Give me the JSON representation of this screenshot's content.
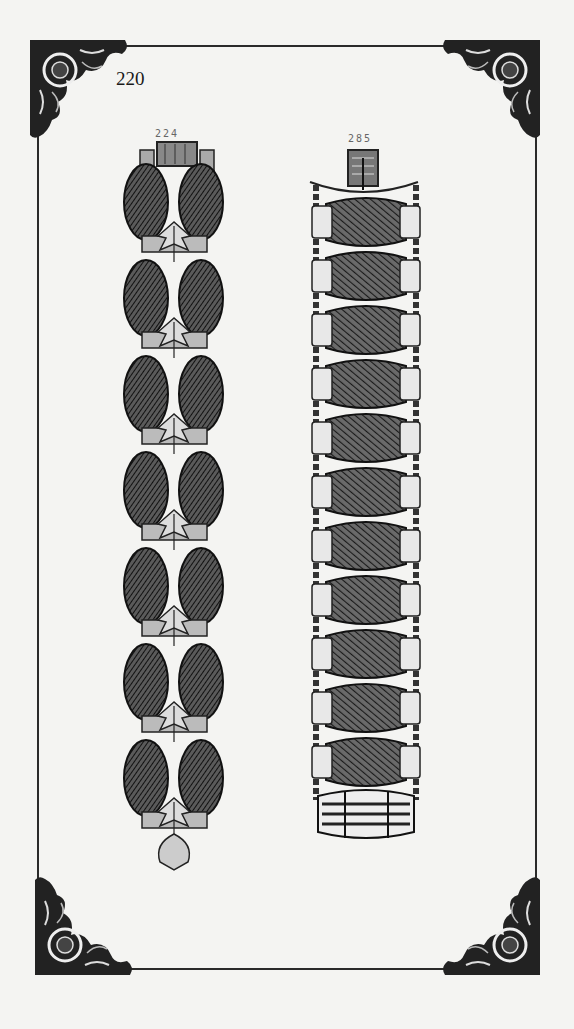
{
  "page": {
    "page_number": "220",
    "background": "#f4f4f2",
    "ink": "#1e1e1e"
  },
  "items": [
    {
      "number": "224",
      "type": "bracelet",
      "description": "Oval linked bracelet with leaf ornaments",
      "link_pairs": 7
    },
    {
      "number": "285",
      "type": "bracelet",
      "description": "Barrel link bracelet with side chains",
      "barrel_links": 11,
      "end_piece": "striped barrel"
    }
  ]
}
